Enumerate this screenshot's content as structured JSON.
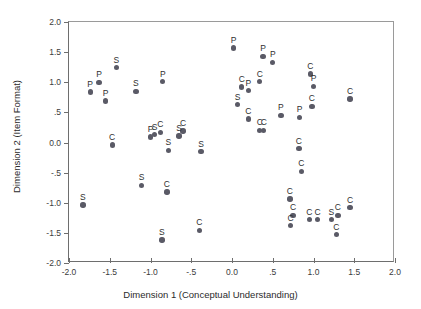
{
  "chart_data": {
    "type": "scatter",
    "title": "",
    "xlabel": "Dimension 1 (Conceptual Understanding)",
    "ylabel": "Dimension 2 (Item Format)",
    "xlim": [
      -2.0,
      2.0
    ],
    "ylim": [
      -2.0,
      2.0
    ],
    "xticks": [
      "-2.0",
      "-1.5",
      "-1.0",
      "-.5",
      "0.0",
      ".5",
      "1.0",
      "1.5",
      "2.0"
    ],
    "xtick_values": [
      -2.0,
      -1.5,
      -1.0,
      -0.5,
      0.0,
      0.5,
      1.0,
      1.5,
      2.0
    ],
    "yticks": [
      "2.0",
      "1.5",
      "1.0",
      ".5",
      "0.0",
      "-.5",
      "-1.0",
      "-1.5",
      "-2.0"
    ],
    "ytick_values": [
      2.0,
      1.5,
      1.0,
      0.5,
      0.0,
      -0.5,
      -1.0,
      -1.5,
      -2.0
    ],
    "grid": false,
    "legend": "none",
    "marker_color": "#5a5a66",
    "point_label_categories": [
      "P",
      "C",
      "S"
    ],
    "points": [
      {
        "x": -1.42,
        "y": 1.24,
        "label": "S"
      },
      {
        "x": -1.63,
        "y": 1.0,
        "label": "P"
      },
      {
        "x": -1.74,
        "y": 0.84,
        "label": "P"
      },
      {
        "x": -1.55,
        "y": 0.69,
        "label": "P"
      },
      {
        "x": -1.18,
        "y": 0.85,
        "label": "S"
      },
      {
        "x": -0.85,
        "y": 1.01,
        "label": "P"
      },
      {
        "x": -0.88,
        "y": 0.17,
        "label": "C"
      },
      {
        "x": -0.95,
        "y": 0.13,
        "label": "S"
      },
      {
        "x": -1.0,
        "y": 0.09,
        "label": "P"
      },
      {
        "x": -1.47,
        "y": -0.04,
        "label": "C"
      },
      {
        "x": -0.6,
        "y": 0.19,
        "label": "C"
      },
      {
        "x": -0.65,
        "y": 0.11,
        "label": "S"
      },
      {
        "x": -0.78,
        "y": -0.13,
        "label": "S"
      },
      {
        "x": -1.11,
        "y": -0.71,
        "label": "S"
      },
      {
        "x": -0.8,
        "y": -0.82,
        "label": "C"
      },
      {
        "x": -1.83,
        "y": -1.04,
        "label": "S"
      },
      {
        "x": -0.4,
        "y": -1.46,
        "label": "C"
      },
      {
        "x": -0.86,
        "y": -1.62,
        "label": "S"
      },
      {
        "x": -0.38,
        "y": -0.15,
        "label": "S"
      },
      {
        "x": 0.02,
        "y": 1.57,
        "label": "P"
      },
      {
        "x": 0.38,
        "y": 1.43,
        "label": "P"
      },
      {
        "x": 0.5,
        "y": 1.33,
        "label": "P"
      },
      {
        "x": 0.12,
        "y": 0.92,
        "label": "C"
      },
      {
        "x": 0.2,
        "y": 0.86,
        "label": "P"
      },
      {
        "x": 0.34,
        "y": 1.01,
        "label": "C"
      },
      {
        "x": 0.07,
        "y": 0.63,
        "label": "S"
      },
      {
        "x": 0.96,
        "y": 1.14,
        "label": "C"
      },
      {
        "x": 1.0,
        "y": 0.93,
        "label": "P"
      },
      {
        "x": 0.98,
        "y": 0.6,
        "label": "C"
      },
      {
        "x": 1.45,
        "y": 0.72,
        "label": "C"
      },
      {
        "x": 0.6,
        "y": 0.45,
        "label": "P"
      },
      {
        "x": 0.83,
        "y": 0.42,
        "label": "P"
      },
      {
        "x": 0.34,
        "y": 0.2,
        "label": "C"
      },
      {
        "x": 0.39,
        "y": 0.2,
        "label": "C"
      },
      {
        "x": 0.2,
        "y": 0.39,
        "label": "C"
      },
      {
        "x": 0.82,
        "y": -0.1,
        "label": "C"
      },
      {
        "x": 0.85,
        "y": -0.48,
        "label": "C"
      },
      {
        "x": 0.71,
        "y": -0.94,
        "label": "C"
      },
      {
        "x": 0.75,
        "y": -1.21,
        "label": "C"
      },
      {
        "x": 0.72,
        "y": -1.38,
        "label": "C"
      },
      {
        "x": 0.95,
        "y": -1.28,
        "label": "C"
      },
      {
        "x": 1.05,
        "y": -1.28,
        "label": "C"
      },
      {
        "x": 1.22,
        "y": -1.28,
        "label": "S"
      },
      {
        "x": 1.3,
        "y": -1.21,
        "label": "C"
      },
      {
        "x": 1.28,
        "y": -1.53,
        "label": "C"
      },
      {
        "x": 1.45,
        "y": -1.08,
        "label": "C"
      }
    ]
  }
}
